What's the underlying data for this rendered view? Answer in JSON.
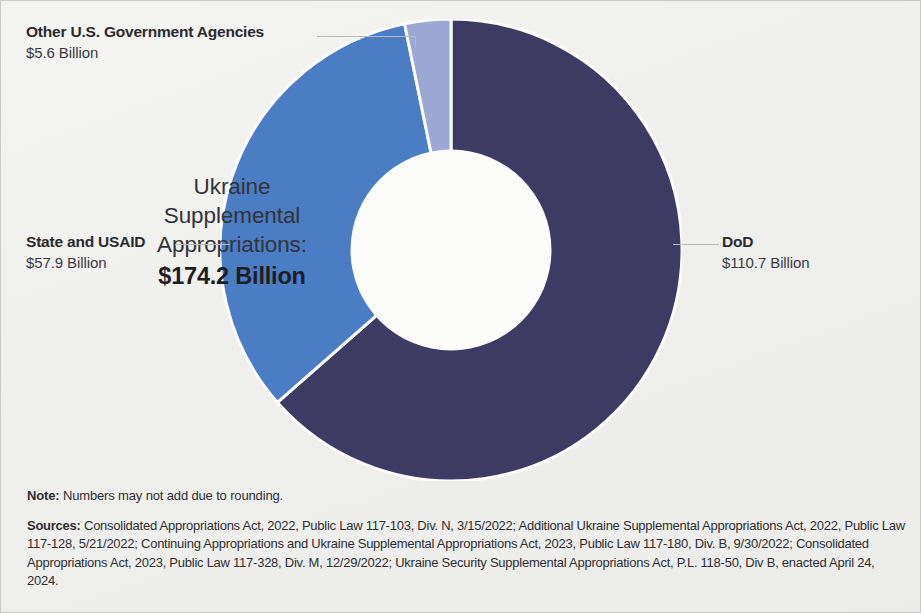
{
  "chart_data": {
    "type": "pie",
    "title": "Ukraine Supplemental Appropriations",
    "subtitle": "",
    "xlabel": "",
    "ylabel": "",
    "unit": "Billion USD",
    "total": 174.2,
    "total_display": "$174.2 Billion",
    "donut": true,
    "inner_radius_ratio": 0.435,
    "start_angle_deg": 0,
    "direction": "clockwise",
    "legend_position": "callout-labels",
    "grid": false,
    "categories": [
      "DoD",
      "State and USAID",
      "Other U.S. Government Agencies"
    ],
    "values": [
      110.7,
      57.9,
      5.6
    ],
    "value_labels": [
      "$110.7 Billion",
      "$57.9 Billion",
      "$5.6 Billion"
    ],
    "percentages": [
      63.5,
      33.2,
      3.2
    ],
    "colors": [
      "#3d3a63",
      "#4a7dc4",
      "#9ba8d4"
    ],
    "slices": [
      {
        "name": "DoD",
        "value": 110.7,
        "value_label": "$110.7 Billion",
        "percent": 63.5,
        "color": "#3d3a63",
        "start_deg": 0,
        "end_deg": 228.7
      },
      {
        "name": "State and USAID",
        "value": 57.9,
        "value_label": "$57.9 Billion",
        "percent": 33.2,
        "color": "#4a7dc4",
        "start_deg": 228.7,
        "end_deg": 348.4
      },
      {
        "name": "Other U.S. Government Agencies",
        "value": 5.6,
        "value_label": "$5.6 Billion",
        "percent": 3.2,
        "color": "#9ba8d4",
        "start_deg": 348.4,
        "end_deg": 360
      }
    ]
  },
  "center": {
    "line1": "Ukraine",
    "line2": "Supplemental",
    "line3": "Appropriations:",
    "total": "$174.2 Billion"
  },
  "callouts": {
    "other": {
      "name": "Other U.S. Government Agencies",
      "value": "$5.6 Billion"
    },
    "state": {
      "name": "State and USAID",
      "value": "$57.9 Billion"
    },
    "dod": {
      "name": "DoD",
      "value": "$110.7 Billion"
    }
  },
  "footnotes": {
    "note_label": "Note:",
    "note_text": " Numbers may not add due to rounding.",
    "sources_label": "Sources:",
    "sources_text": " Consolidated Appropriations Act, 2022, Public Law 117-103, Div. N, 3/15/2022; Additional Ukraine Supplemental Appropriations Act, 2022, Public Law 117-128, 5/21/2022; Continuing Appropriations and Ukraine Supplemental Appropriations Act, 2023, Public Law 117-180, Div. B, 9/30/2022; Consolidated Appropriations Act, 2023, Public Law 117-328, Div. M, 12/29/2022; Ukraine Security Supplemental Appropriations Act, P.L. 118-50, Div B, enacted April 24, 2024."
  }
}
